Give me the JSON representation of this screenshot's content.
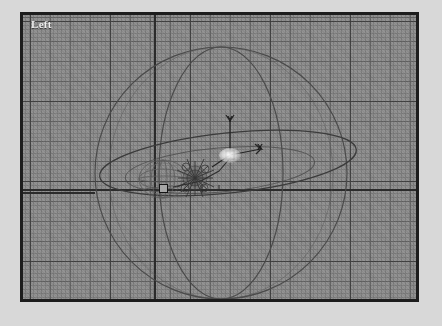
{
  "app": {
    "background_color": "#d8d8d8"
  },
  "viewport": {
    "label": "Left",
    "frame": {
      "border_color": "#1d1d1d",
      "background_color": "#8e8e8e",
      "x": 20,
      "y": 12,
      "width": 399,
      "height": 290
    },
    "grid": {
      "minor_spacing_px": 4,
      "mid_spacing_px": 20,
      "major_spacing_px": 80,
      "minor_color": "#787878",
      "mid_color": "#5f5f5f",
      "major_color": "#3c3c3c",
      "visible": true
    },
    "axes": {
      "horizontal_color": "#2b2b2b",
      "vertical_color": "#2b2b2b",
      "horizontal_y": 174,
      "vertical_x": 131
    }
  },
  "gizmo": {
    "name": "transform-gizmo",
    "origin": {
      "x": 207,
      "y": 140
    },
    "axis_labels": [
      {
        "axis": "Y",
        "label": "Y",
        "x": 204,
        "y": 100
      },
      {
        "axis": "X",
        "label": "X",
        "x": 234,
        "y": 128
      }
    ],
    "line_color": "#262626"
  },
  "objects": [
    {
      "name": "sphere-wireframe-large",
      "type": "circle",
      "cx": 198,
      "cy": 158,
      "r": 126,
      "stroke": "#4e4e4e"
    },
    {
      "name": "sphere-meridian-ellipse",
      "type": "ellipse",
      "cx": 198,
      "cy": 158,
      "rx": 62,
      "ry": 126,
      "stroke": "#4e4e4e"
    },
    {
      "name": "orbit-path-ellipse",
      "type": "ellipse",
      "cx": 205,
      "cy": 148,
      "rx": 129,
      "ry": 30,
      "rotation_deg": -6,
      "stroke": "#3f3f3f"
    },
    {
      "name": "sphere-small-wireframe",
      "type": "sphere",
      "cx": 140,
      "cy": 164,
      "rx": 24,
      "ry": 19,
      "stroke": "#5a5a5a"
    },
    {
      "name": "spiky-cluster-object",
      "type": "cluster",
      "cx": 172,
      "cy": 163,
      "stroke": "#363636"
    },
    {
      "name": "trajectory-line",
      "type": "polyline",
      "stroke": "#2f2f2f"
    }
  ],
  "selection": {
    "marker": {
      "name": "selection-box-marker",
      "x": 136,
      "y": 169,
      "size": 9,
      "stroke": "#141414",
      "fill": "#a6a6a6"
    },
    "highlight": {
      "name": "selection-highlight-glow",
      "x": 196,
      "y": 133,
      "color": "#ffffff"
    }
  }
}
